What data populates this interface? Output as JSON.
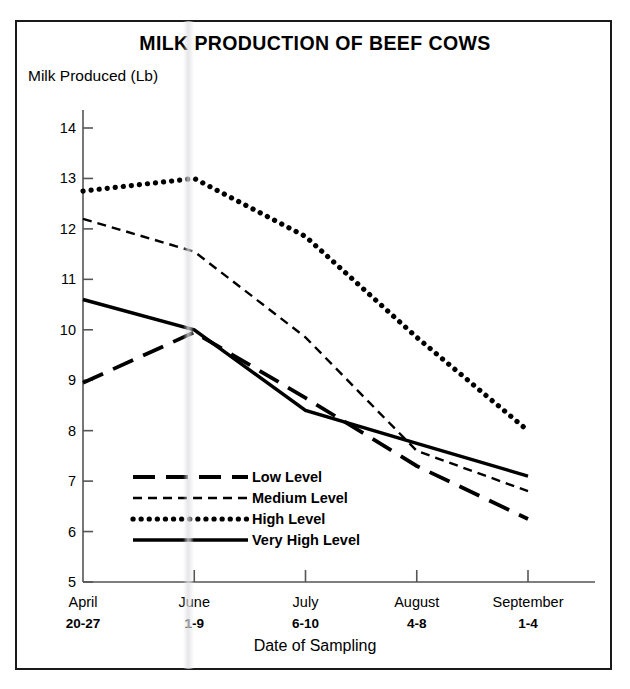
{
  "chart_data": {
    "type": "line",
    "title": "MILK PRODUCTION OF BEEF COWS",
    "xlabel": "Date of Sampling",
    "ylabel": "Milk Produced (Lb)",
    "categories": [
      "April 20-27",
      "June 1-9",
      "July 6-10",
      "August 4-8",
      "September 1-4"
    ],
    "x_tick_labels": [
      {
        "line1": "April",
        "line2": "20-27"
      },
      {
        "line1": "June",
        "line2": "1-9"
      },
      {
        "line1": "July",
        "line2": "6-10"
      },
      {
        "line1": "August",
        "line2": "4-8"
      },
      {
        "line1": "September",
        "line2": "1-4"
      }
    ],
    "y_tick_labels": [
      "5",
      "6",
      "7",
      "8",
      "9",
      "10",
      "11",
      "12",
      "13",
      "14"
    ],
    "y_tick_values": [
      5,
      6,
      7,
      8,
      9,
      10,
      11,
      12,
      13,
      14
    ],
    "ylim": [
      5,
      14
    ],
    "grid": false,
    "legend_position": "inside-lower-left",
    "series": [
      {
        "name": "Low Level",
        "style": "long-dash",
        "color": "#000000",
        "values": [
          8.95,
          9.95,
          8.65,
          7.3,
          6.25
        ]
      },
      {
        "name": "Medium Level",
        "style": "short-dash",
        "color": "#000000",
        "values": [
          12.2,
          11.55,
          9.85,
          7.6,
          6.8
        ]
      },
      {
        "name": "High Level",
        "style": "dotted",
        "color": "#000000",
        "values": [
          12.75,
          13.0,
          11.85,
          9.85,
          8.0
        ]
      },
      {
        "name": "Very High Level",
        "style": "solid",
        "color": "#000000",
        "values": [
          10.6,
          10.0,
          8.4,
          7.75,
          7.1
        ]
      }
    ]
  },
  "figure": {
    "title": "MILK PRODUCTION OF BEEF COWS",
    "ylabel": "Milk Produced (Lb)",
    "xlabel": "Date of Sampling"
  },
  "legend": {
    "entries": [
      {
        "label": "Low Level"
      },
      {
        "label": "Medium Level"
      },
      {
        "label": "High Level"
      },
      {
        "label": "Very High Level"
      }
    ]
  }
}
